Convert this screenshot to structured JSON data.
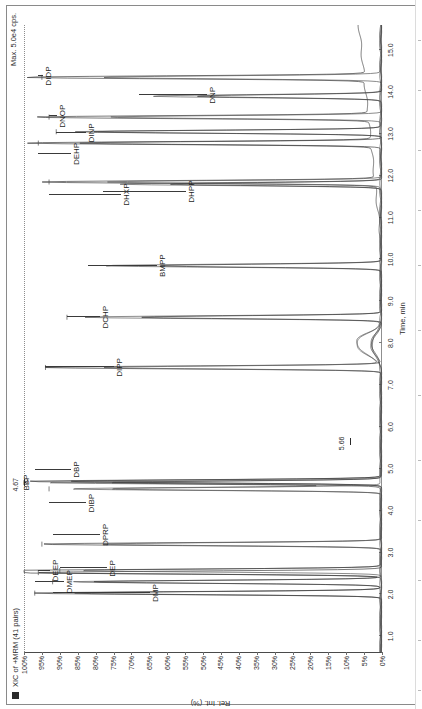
{
  "header": {
    "legend_swatch_color": "#2b2b2b",
    "title": "XIC of +MRM (41 pairs)",
    "max_label": "Max. 5.0e4 cps."
  },
  "chart_data": {
    "type": "line",
    "title": "XIC of +MRM (41 pairs)",
    "subtitle": "Max. 5.0e4 cps.",
    "xlabel": "Time, min",
    "ylabel": "Rel. Int. (%)",
    "xlim": [
      0.6,
      15.6
    ],
    "ylim": [
      0,
      100
    ],
    "grid": false,
    "legend_position": "none",
    "rotation_deg": -90,
    "xticks": [
      "1.0",
      "2.0",
      "3.0",
      "4.0",
      "5.0",
      "6.0",
      "7.0",
      "8.0",
      "9.0",
      "10.0",
      "11.0",
      "12.0",
      "13.0",
      "14.0",
      "15.0"
    ],
    "yticks": [
      "0%",
      "5%",
      "10%",
      "15%",
      "20%",
      "25%",
      "30%",
      "35%",
      "40%",
      "45%",
      "50%",
      "55%",
      "60%",
      "65%",
      "70%",
      "75%",
      "80%",
      "85%",
      "90%",
      "95%",
      "100%"
    ],
    "annotations": [
      {
        "text": "4.67",
        "x": 4.67,
        "y": 100
      },
      {
        "text": "5.66",
        "x": 5.66,
        "y": 9
      }
    ],
    "peaks": [
      {
        "label": "DMP",
        "x": 2.03,
        "height": 97
      },
      {
        "label": "DMEP",
        "x": 2.3,
        "height": 92
      },
      {
        "label": "DEP",
        "x": 2.52,
        "height": 96
      },
      {
        "label": "DEEP",
        "x": 2.57,
        "height": 90
      },
      {
        "label": "DPRP",
        "x": 3.2,
        "height": 95
      },
      {
        "label": "DIBP",
        "x": 4.52,
        "height": 93
      },
      {
        "label": "DBP",
        "x": 4.7,
        "height": 99
      },
      {
        "label": "BBP",
        "x": 4.67,
        "height": 100
      },
      {
        "label": "DIPP",
        "x": 7.42,
        "height": 94
      },
      {
        "label": "DCHP",
        "x": 8.62,
        "height": 88
      },
      {
        "label": "BMPP",
        "x": 9.85,
        "height": 82
      },
      {
        "label": "DHXP",
        "x": 11.85,
        "height": 93
      },
      {
        "label": "DHPP",
        "x": 11.8,
        "height": 78
      },
      {
        "label": "DEHP",
        "x": 12.78,
        "height": 96
      },
      {
        "label": "DINP",
        "x": 13.05,
        "height": 91
      },
      {
        "label": "DNOP",
        "x": 13.4,
        "height": 93
      },
      {
        "label": "DNP",
        "x": 13.9,
        "height": 68
      },
      {
        "label": "DIDP",
        "x": 14.35,
        "height": 95
      }
    ]
  }
}
